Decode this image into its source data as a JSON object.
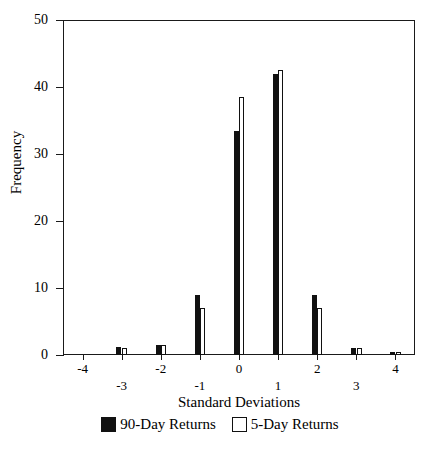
{
  "chart_data": {
    "type": "bar",
    "title": "",
    "subtitle": "",
    "xlabel": "Standard Deviations",
    "ylabel": "Frequency",
    "categories": [
      -4,
      -3,
      -2,
      -1,
      0,
      1,
      2,
      3,
      4
    ],
    "x": [
      -4,
      -3,
      -2,
      -1,
      0,
      1,
      2,
      3,
      4
    ],
    "series": [
      {
        "name": "90-Day Returns",
        "color": "#111111",
        "style": "filled",
        "values": [
          0,
          1.2,
          1.5,
          9,
          33.5,
          42,
          9,
          1,
          0.5
        ]
      },
      {
        "name": "5-Day Returns",
        "color": "#ffffff",
        "style": "outlined",
        "values": [
          0,
          1,
          1.5,
          7,
          38.5,
          42.5,
          7,
          1,
          0.5
        ]
      }
    ],
    "xlim": [
      -4.5,
      4.5
    ],
    "ylim": [
      0,
      50
    ],
    "yticks": [
      0,
      10,
      20,
      30,
      40,
      50
    ],
    "ytick_labels": [
      "0",
      "10",
      "20",
      "30",
      "40",
      "50"
    ],
    "xticks": [
      -4,
      -3,
      -2,
      -1,
      0,
      1,
      2,
      3,
      4
    ],
    "xtick_labels": [
      "-4",
      "-3",
      "-2",
      "-1",
      "0",
      "1",
      "2",
      "3",
      "4"
    ],
    "xtick_label_rows": [
      0,
      1,
      0,
      1,
      0,
      1,
      0,
      1,
      0
    ],
    "grid": false,
    "legend_position": "bottom"
  },
  "legend": {
    "entries": [
      {
        "label": "90-Day Returns",
        "swatch": "filled-black-square"
      },
      {
        "label": "5-Day Returns",
        "swatch": "outlined-white-square"
      }
    ]
  }
}
